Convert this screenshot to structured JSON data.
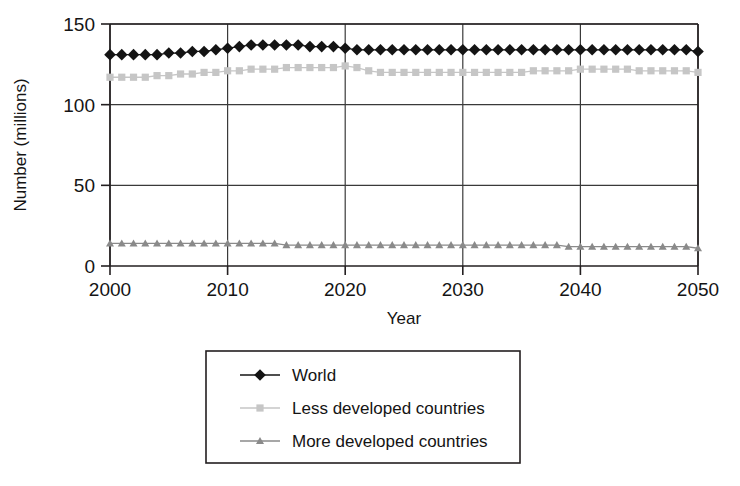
{
  "chart_data": {
    "type": "line",
    "title": "",
    "xlabel": "Year",
    "ylabel": "Number (millions)",
    "xlim": [
      2000,
      2050
    ],
    "ylim": [
      0,
      150
    ],
    "xticks": [
      "2000",
      "2010",
      "2020",
      "2030",
      "2040",
      "2050"
    ],
    "yticks": [
      "0",
      "50",
      "100",
      "150"
    ],
    "grid": "both-axes-at-ticks",
    "legend_position": "below-plot-center",
    "x": [
      2000,
      2001,
      2002,
      2003,
      2004,
      2005,
      2006,
      2007,
      2008,
      2009,
      2010,
      2011,
      2012,
      2013,
      2014,
      2015,
      2016,
      2017,
      2018,
      2019,
      2020,
      2021,
      2022,
      2023,
      2024,
      2025,
      2026,
      2027,
      2028,
      2029,
      2030,
      2031,
      2032,
      2033,
      2034,
      2035,
      2036,
      2037,
      2038,
      2039,
      2040,
      2041,
      2042,
      2043,
      2044,
      2045,
      2046,
      2047,
      2048,
      2049,
      2050
    ],
    "series": [
      {
        "name": "World",
        "marker": "diamond",
        "color": "#141414",
        "values": [
          131,
          131,
          131,
          131,
          131,
          132,
          132,
          133,
          133,
          134,
          135,
          136,
          137,
          137,
          137,
          137,
          137,
          136,
          136,
          136,
          135,
          134,
          134,
          134,
          134,
          134,
          134,
          134,
          134,
          134,
          134,
          134,
          134,
          134,
          134,
          134,
          134,
          134,
          134,
          134,
          134,
          134,
          134,
          134,
          134,
          134,
          134,
          134,
          134,
          134,
          133
        ]
      },
      {
        "name": "Less developed countries",
        "marker": "square",
        "color": "#c6c6c6",
        "values": [
          117,
          117,
          117,
          117,
          118,
          118,
          119,
          119,
          120,
          120,
          121,
          121,
          122,
          122,
          122,
          123,
          123,
          123,
          123,
          123,
          124,
          123,
          121,
          120,
          120,
          120,
          120,
          120,
          120,
          120,
          120,
          120,
          120,
          120,
          120,
          120,
          121,
          121,
          121,
          121,
          122,
          122,
          122,
          122,
          122,
          121,
          121,
          121,
          121,
          121,
          120
        ]
      },
      {
        "name": "More developed countries",
        "marker": "triangle",
        "color": "#8a8a8a",
        "values": [
          14,
          14,
          14,
          14,
          14,
          14,
          14,
          14,
          14,
          14,
          14,
          14,
          14,
          14,
          14,
          13,
          13,
          13,
          13,
          13,
          13,
          13,
          13,
          13,
          13,
          13,
          13,
          13,
          13,
          13,
          13,
          13,
          13,
          13,
          13,
          13,
          13,
          13,
          13,
          12,
          12,
          12,
          12,
          12,
          12,
          12,
          12,
          12,
          12,
          12,
          11
        ]
      }
    ]
  },
  "colors": {
    "axis": "#231f20",
    "grid": "#3a3a3a",
    "background": "#ffffff",
    "world": "#141414",
    "less_developed": "#c6c6c6",
    "more_developed": "#8a8a8a"
  }
}
